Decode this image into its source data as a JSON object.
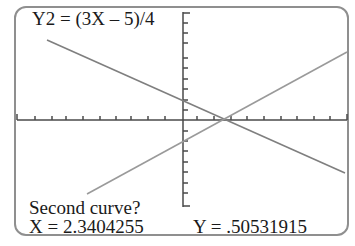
{
  "screen": {
    "equation_label": "Y2 = (3X – 5)/4",
    "prompt": "Second curve?",
    "x_readout": "X = 2.3404255",
    "y_readout": "Y = .50531915"
  },
  "graph": {
    "axis_color": "#4a4a4a",
    "line_color": "#8a8a8a",
    "frame_color": "#8f8f8f",
    "intersection": {
      "x": 2.3404255,
      "y": 0.50531915
    },
    "curves": [
      {
        "name": "Y1",
        "slope": "negative",
        "description": "decreasing line"
      },
      {
        "name": "Y2",
        "equation": "(3X - 5)/4",
        "slope": "positive"
      }
    ]
  }
}
